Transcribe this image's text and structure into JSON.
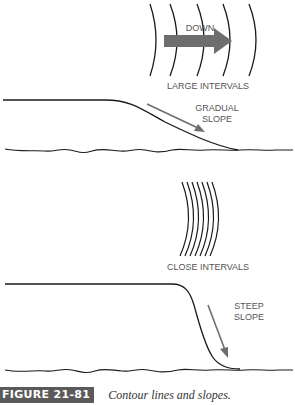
{
  "diagram": {
    "top_panel": {
      "direction_label": "DOWN",
      "interval_label": "LARGE INTERVALS",
      "slope_label_line1": "GRADUAL",
      "slope_label_line2": "SLOPE",
      "contour_line_count": 5
    },
    "bottom_panel": {
      "interval_label": "CLOSE INTERVALS",
      "slope_label_line1": "STEEP",
      "slope_label_line2": "SLOPE",
      "contour_line_count": 7
    },
    "colors": {
      "line": "#1a1a1a",
      "arrow": "#6e6e6e",
      "label": "#555555",
      "caption_badge": "#5a5a5a"
    }
  },
  "caption": {
    "figure_number": "FIGURE 21-81",
    "text": "Contour lines and slopes."
  }
}
